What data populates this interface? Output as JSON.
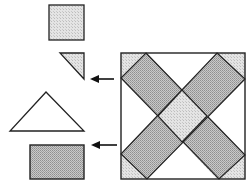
{
  "diagram": {
    "colors": {
      "stroke": "#222222",
      "shade_dark": "#b8b8b8",
      "shade_light": "#dcdcdc",
      "background": "#ffffff"
    },
    "pieces": [
      {
        "id": "small-square",
        "shape": "square",
        "fill": "light-shaded"
      },
      {
        "id": "small-right-triangle",
        "shape": "right-triangle",
        "fill": "light-shaded",
        "arrow_to_block": true
      },
      {
        "id": "large-triangle",
        "shape": "isosceles-triangle",
        "fill": "unshaded"
      },
      {
        "id": "rectangle",
        "shape": "rectangle",
        "fill": "dark-shaded",
        "arrow_to_block": true
      }
    ],
    "block": {
      "shape": "square",
      "content": "X of two crossing shaded rectangular bands, small shaded corner triangles, light shaded center square, white side triangles"
    }
  }
}
